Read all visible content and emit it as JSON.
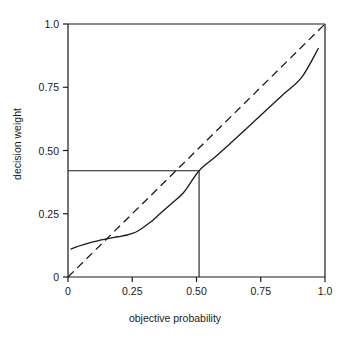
{
  "chart_data": {
    "type": "line",
    "title": "",
    "xlabel": "objective probability",
    "ylabel": "decision weight",
    "xlim": [
      0,
      1.0
    ],
    "ylim": [
      0,
      1.0
    ],
    "grid": false,
    "legend": "none",
    "xticks": [
      {
        "value": 0,
        "label": "0"
      },
      {
        "value": 0.25,
        "label": "0.25"
      },
      {
        "value": 0.5,
        "label": "0.50"
      },
      {
        "value": 0.75,
        "label": "0.75"
      },
      {
        "value": 1.0,
        "label": "1.0"
      }
    ],
    "yticks": [
      {
        "value": 0,
        "label": "0"
      },
      {
        "value": 0.25,
        "label": "0.25"
      },
      {
        "value": 0.5,
        "label": "0.50"
      },
      {
        "value": 0.75,
        "label": "0.75"
      },
      {
        "value": 1.0,
        "label": "1.0"
      }
    ],
    "series": [
      {
        "name": "decision weight function",
        "style": "solid",
        "color": "#1a1a1a",
        "x": [
          0.01,
          0.03,
          0.06,
          0.09,
          0.12,
          0.15,
          0.18,
          0.205,
          0.23,
          0.25,
          0.27,
          0.29,
          0.32,
          0.36,
          0.4,
          0.45,
          0.51,
          0.57,
          0.63,
          0.7,
          0.77,
          0.84,
          0.91,
          0.975
        ],
        "y": [
          0.11,
          0.118,
          0.128,
          0.137,
          0.144,
          0.151,
          0.157,
          0.161,
          0.166,
          0.172,
          0.181,
          0.194,
          0.216,
          0.252,
          0.288,
          0.334,
          0.42,
          0.472,
          0.527,
          0.592,
          0.658,
          0.724,
          0.79,
          0.905
        ]
      },
      {
        "name": "identity line",
        "style": "dashed",
        "color": "#1a1a1a",
        "x": [
          0,
          1.0
        ],
        "y": [
          0,
          1.0
        ]
      }
    ],
    "annotations": [
      {
        "name": "reference-horizontal",
        "type": "hline-segment",
        "y": 0.42,
        "x_from": 0,
        "x_to": 0.51,
        "style": "solid"
      },
      {
        "name": "reference-vertical",
        "type": "vline-segment",
        "x": 0.51,
        "y_from": 0,
        "y_to": 0.42,
        "style": "solid"
      }
    ],
    "frame": {
      "top_spine": true,
      "right_spine": true,
      "left_spine": true,
      "bottom_spine": true
    }
  }
}
